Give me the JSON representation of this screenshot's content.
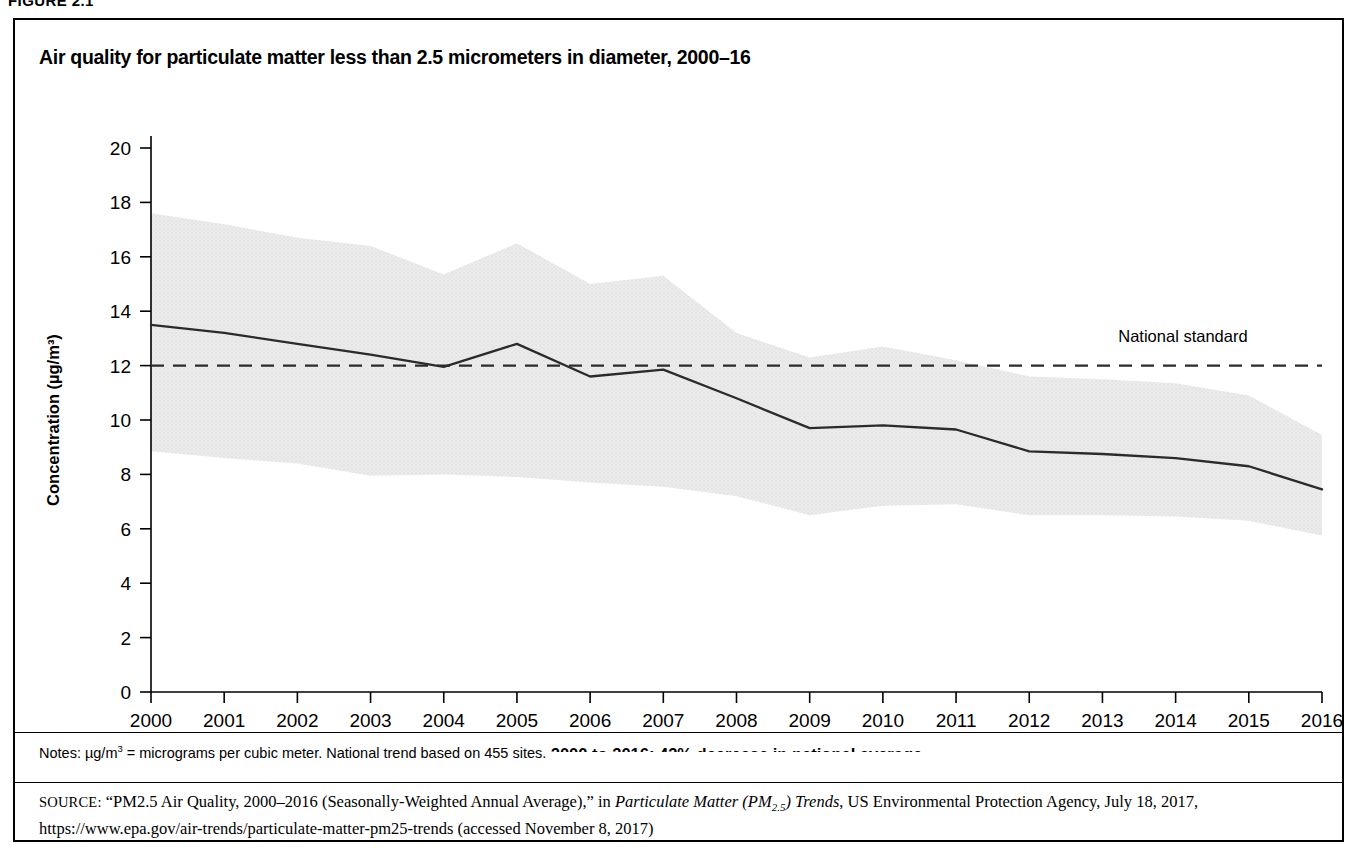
{
  "figure": {
    "number": "FIGURE 2.1",
    "title": "Air quality for particulate matter less than 2.5 micrometers in diameter, 2000–16"
  },
  "notes": {
    "prefix": "Notes: µg/m",
    "superscript": "3",
    "text": " = micrograms per cubic meter. National trend based on 455 sites."
  },
  "source": {
    "label": "SOURCE:",
    "part1": " “PM2.5 Air Quality, 2000–2016 (Seasonally-Weighted Annual Average),” in ",
    "italic_title": "Particulate Matter (PM",
    "italic_sub": "2.5",
    "italic_title_end": ") Trends",
    "part2": ", US Environmental Protection Agency, July 18, 2017, https://www.epa.gov/air-trends/particulate-matter-pm25-trends (accessed November 8, 2017)"
  },
  "chart_data": {
    "type": "line",
    "title": "Air quality for particulate matter less than 2.5 micrometers in diameter, 2000–16",
    "xlabel": "2000 to 2016: 42% decrease in national average",
    "ylabel": "Concentration (µg/m³)",
    "xlim": [
      2000,
      2016
    ],
    "ylim": [
      0,
      20
    ],
    "ytick_step": 2,
    "yticks": [
      0,
      2,
      4,
      6,
      8,
      10,
      12,
      14,
      16,
      18,
      20
    ],
    "xticks": [
      2000,
      2001,
      2002,
      2003,
      2004,
      2005,
      2006,
      2007,
      2008,
      2009,
      2010,
      2011,
      2012,
      2013,
      2014,
      2015,
      2016
    ],
    "grid": false,
    "legend_position": "inline-annotation",
    "x": [
      2000,
      2001,
      2002,
      2003,
      2004,
      2005,
      2006,
      2007,
      2008,
      2009,
      2010,
      2011,
      2012,
      2013,
      2014,
      2015,
      2016
    ],
    "series": [
      {
        "name": "National average",
        "type": "line",
        "color": "#2b2b2b",
        "values": [
          13.5,
          13.2,
          12.8,
          12.4,
          11.95,
          12.8,
          11.6,
          11.85,
          10.8,
          9.7,
          9.8,
          9.65,
          8.85,
          8.75,
          8.6,
          8.3,
          7.45
        ]
      },
      {
        "name": "90th percentile (band upper)",
        "type": "band-upper",
        "color": "#e3e3e3",
        "values": [
          17.6,
          17.2,
          16.7,
          16.4,
          15.35,
          16.5,
          15.0,
          15.3,
          13.2,
          12.3,
          12.7,
          12.2,
          11.6,
          11.5,
          11.35,
          10.9,
          9.45
        ]
      },
      {
        "name": "10th percentile (band lower)",
        "type": "band-lower",
        "color": "#e3e3e3",
        "values": [
          8.85,
          8.6,
          8.4,
          7.95,
          8.0,
          7.9,
          7.7,
          7.55,
          7.2,
          6.5,
          6.85,
          6.9,
          6.5,
          6.5,
          6.45,
          6.3,
          5.75
        ]
      }
    ],
    "reference_line": {
      "name": "National standard",
      "value": 12,
      "style": "dashed",
      "label": "National standard",
      "label_x": 2014.1,
      "label_y": 12.85,
      "color": "#2b2b2b"
    },
    "band_color": "#e6e6e6",
    "line_color": "#2b2b2b",
    "axis_color": "#000000"
  }
}
